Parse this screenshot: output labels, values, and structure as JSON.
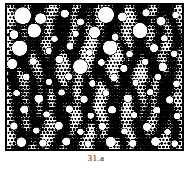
{
  "figure": {
    "caption": "31.a",
    "plate": {
      "alt_name": "halftone-dot-screen-micrograph",
      "frame_border_color": "#000000",
      "frame_border_width_px": 2,
      "background_color": "#ffffff",
      "ink_color": "#000000",
      "width_px": 179,
      "height_px": 148
    }
  },
  "chart_data": {
    "type": "heatmap",
    "title": "31.a",
    "xlabel": "",
    "ylabel": "",
    "halftone": {
      "cell_px": 3.6,
      "dot_max_radius_ratio": 0.62,
      "base_density": 0.52,
      "ink": "#000000",
      "paper": "#ffffff"
    },
    "streaks": [
      {
        "x": 0.055,
        "amp": 0.018,
        "width": 0.03,
        "strength": 0.52,
        "phase": 0.4
      },
      {
        "x": 0.135,
        "amp": 0.024,
        "width": 0.026,
        "strength": 0.6,
        "phase": 1.5
      },
      {
        "x": 0.205,
        "amp": 0.02,
        "width": 0.022,
        "strength": 0.46,
        "phase": 2.7
      },
      {
        "x": 0.285,
        "amp": 0.028,
        "width": 0.03,
        "strength": 0.66,
        "phase": 0.9
      },
      {
        "x": 0.355,
        "amp": 0.018,
        "width": 0.024,
        "strength": 0.5,
        "phase": 3.4
      },
      {
        "x": 0.43,
        "amp": 0.026,
        "width": 0.028,
        "strength": 0.62,
        "phase": 2.0
      },
      {
        "x": 0.505,
        "amp": 0.02,
        "width": 0.022,
        "strength": 0.48,
        "phase": 5.1
      },
      {
        "x": 0.58,
        "amp": 0.03,
        "width": 0.032,
        "strength": 0.68,
        "phase": 1.1
      },
      {
        "x": 0.655,
        "amp": 0.018,
        "width": 0.024,
        "strength": 0.5,
        "phase": 4.2
      },
      {
        "x": 0.73,
        "amp": 0.026,
        "width": 0.028,
        "strength": 0.6,
        "phase": 0.2
      },
      {
        "x": 0.8,
        "amp": 0.02,
        "width": 0.022,
        "strength": 0.46,
        "phase": 3.0
      },
      {
        "x": 0.87,
        "amp": 0.028,
        "width": 0.03,
        "strength": 0.64,
        "phase": 1.8
      },
      {
        "x": 0.945,
        "amp": 0.018,
        "width": 0.026,
        "strength": 0.52,
        "phase": 5.6
      }
    ],
    "voids": [
      {
        "x": 0.09,
        "y": 0.075,
        "r": 0.049
      },
      {
        "x": 0.192,
        "y": 0.095,
        "r": 0.032
      },
      {
        "x": 0.33,
        "y": 0.06,
        "r": 0.024
      },
      {
        "x": 0.42,
        "y": 0.118,
        "r": 0.022
      },
      {
        "x": 0.565,
        "y": 0.068,
        "r": 0.046
      },
      {
        "x": 0.66,
        "y": 0.082,
        "r": 0.026
      },
      {
        "x": 0.795,
        "y": 0.055,
        "r": 0.022
      },
      {
        "x": 0.88,
        "y": 0.112,
        "r": 0.028
      },
      {
        "x": 0.963,
        "y": 0.07,
        "r": 0.02
      },
      {
        "x": 0.04,
        "y": 0.205,
        "r": 0.026
      },
      {
        "x": 0.155,
        "y": 0.178,
        "r": 0.04
      },
      {
        "x": 0.272,
        "y": 0.235,
        "r": 0.02
      },
      {
        "x": 0.392,
        "y": 0.2,
        "r": 0.02
      },
      {
        "x": 0.5,
        "y": 0.19,
        "r": 0.034
      },
      {
        "x": 0.618,
        "y": 0.222,
        "r": 0.022
      },
      {
        "x": 0.76,
        "y": 0.178,
        "r": 0.044
      },
      {
        "x": 0.9,
        "y": 0.232,
        "r": 0.02
      },
      {
        "x": 0.072,
        "y": 0.3,
        "r": 0.044
      },
      {
        "x": 0.238,
        "y": 0.318,
        "r": 0.02
      },
      {
        "x": 0.36,
        "y": 0.286,
        "r": 0.022
      },
      {
        "x": 0.47,
        "y": 0.33,
        "r": 0.02
      },
      {
        "x": 0.59,
        "y": 0.296,
        "r": 0.042
      },
      {
        "x": 0.7,
        "y": 0.34,
        "r": 0.02
      },
      {
        "x": 0.84,
        "y": 0.3,
        "r": 0.024
      },
      {
        "x": 0.955,
        "y": 0.338,
        "r": 0.02
      },
      {
        "x": 0.03,
        "y": 0.41,
        "r": 0.03
      },
      {
        "x": 0.15,
        "y": 0.392,
        "r": 0.022
      },
      {
        "x": 0.3,
        "y": 0.378,
        "r": 0.024
      },
      {
        "x": 0.42,
        "y": 0.428,
        "r": 0.042
      },
      {
        "x": 0.54,
        "y": 0.4,
        "r": 0.02
      },
      {
        "x": 0.668,
        "y": 0.44,
        "r": 0.022
      },
      {
        "x": 0.79,
        "y": 0.395,
        "r": 0.02
      },
      {
        "x": 0.89,
        "y": 0.43,
        "r": 0.026
      },
      {
        "x": 0.11,
        "y": 0.5,
        "r": 0.022
      },
      {
        "x": 0.24,
        "y": 0.535,
        "r": 0.02
      },
      {
        "x": 0.352,
        "y": 0.498,
        "r": 0.022
      },
      {
        "x": 0.488,
        "y": 0.545,
        "r": 0.02
      },
      {
        "x": 0.612,
        "y": 0.505,
        "r": 0.024
      },
      {
        "x": 0.735,
        "y": 0.54,
        "r": 0.02
      },
      {
        "x": 0.862,
        "y": 0.5,
        "r": 0.022
      },
      {
        "x": 0.968,
        "y": 0.548,
        "r": 0.02
      },
      {
        "x": 0.055,
        "y": 0.612,
        "r": 0.02
      },
      {
        "x": 0.182,
        "y": 0.65,
        "r": 0.026
      },
      {
        "x": 0.312,
        "y": 0.608,
        "r": 0.02
      },
      {
        "x": 0.44,
        "y": 0.655,
        "r": 0.022
      },
      {
        "x": 0.565,
        "y": 0.612,
        "r": 0.02
      },
      {
        "x": 0.69,
        "y": 0.648,
        "r": 0.024
      },
      {
        "x": 0.818,
        "y": 0.605,
        "r": 0.02
      },
      {
        "x": 0.93,
        "y": 0.66,
        "r": 0.022
      },
      {
        "x": 0.098,
        "y": 0.725,
        "r": 0.024
      },
      {
        "x": 0.225,
        "y": 0.76,
        "r": 0.02
      },
      {
        "x": 0.355,
        "y": 0.722,
        "r": 0.022
      },
      {
        "x": 0.478,
        "y": 0.768,
        "r": 0.02
      },
      {
        "x": 0.6,
        "y": 0.728,
        "r": 0.024
      },
      {
        "x": 0.725,
        "y": 0.765,
        "r": 0.02
      },
      {
        "x": 0.855,
        "y": 0.73,
        "r": 0.022
      },
      {
        "x": 0.972,
        "y": 0.772,
        "r": 0.02
      },
      {
        "x": 0.04,
        "y": 0.84,
        "r": 0.022
      },
      {
        "x": 0.168,
        "y": 0.872,
        "r": 0.02
      },
      {
        "x": 0.296,
        "y": 0.838,
        "r": 0.024
      },
      {
        "x": 0.42,
        "y": 0.88,
        "r": 0.02
      },
      {
        "x": 0.545,
        "y": 0.842,
        "r": 0.022
      },
      {
        "x": 0.672,
        "y": 0.878,
        "r": 0.02
      },
      {
        "x": 0.8,
        "y": 0.845,
        "r": 0.024
      },
      {
        "x": 0.918,
        "y": 0.882,
        "r": 0.02
      },
      {
        "x": 0.082,
        "y": 0.952,
        "r": 0.028
      },
      {
        "x": 0.205,
        "y": 0.958,
        "r": 0.022
      },
      {
        "x": 0.338,
        "y": 0.948,
        "r": 0.024
      },
      {
        "x": 0.462,
        "y": 0.962,
        "r": 0.02
      },
      {
        "x": 0.592,
        "y": 0.95,
        "r": 0.03
      },
      {
        "x": 0.718,
        "y": 0.96,
        "r": 0.022
      },
      {
        "x": 0.848,
        "y": 0.948,
        "r": 0.026
      },
      {
        "x": 0.958,
        "y": 0.962,
        "r": 0.02
      }
    ]
  }
}
